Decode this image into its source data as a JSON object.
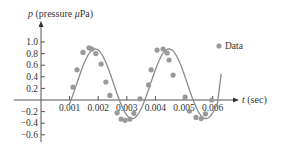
{
  "chart_data": {
    "type": "scatter",
    "title": "",
    "xlabel": "t (sec)",
    "ylabel": "p (pressure μPa)",
    "xlim": [
      0,
      0.0065
    ],
    "ylim": [
      -0.7,
      1.1
    ],
    "grid": false,
    "legend_position": "upper right",
    "x_ticks": [
      0.001,
      0.002,
      0.003,
      0.004,
      0.005,
      0.006
    ],
    "x_tick_labels": [
      "0.001",
      "0.002",
      "0.003",
      "0.004",
      "0.005",
      "0.006"
    ],
    "y_ticks": [
      -0.6,
      -0.4,
      -0.2,
      0.2,
      0.4,
      0.6,
      0.8,
      1.0
    ],
    "y_tick_labels": [
      "−0.6",
      "−0.4",
      "−0.2",
      "0.2",
      "0.4",
      "0.6",
      "0.8",
      "1.0"
    ],
    "series": [
      {
        "name": "Data",
        "kind": "points",
        "color": "#999999",
        "x": [
          0.00112,
          0.00126,
          0.00147,
          0.00168,
          0.00178,
          0.00192,
          0.0021,
          0.00227,
          0.00241,
          0.00266,
          0.0028,
          0.00294,
          0.00311,
          0.00325,
          0.00346,
          0.00376,
          0.00385,
          0.00406,
          0.00427,
          0.00441,
          0.00448,
          0.00462,
          0.00504,
          0.00519,
          0.00542,
          0.0056,
          0.00575,
          0.00597
        ],
        "y": [
          0.22,
          0.52,
          0.82,
          0.9,
          0.88,
          0.8,
          0.62,
          0.31,
          0.08,
          -0.22,
          -0.33,
          -0.35,
          -0.33,
          -0.23,
          0.02,
          0.26,
          0.52,
          0.86,
          0.88,
          0.81,
          0.69,
          0.43,
          0.05,
          -0.19,
          -0.3,
          -0.32,
          -0.24,
          0.0
        ]
      },
      {
        "name": "Fit",
        "kind": "line",
        "color": "#888888",
        "amplitude": 0.6,
        "offset": 0.28,
        "period": 0.00258,
        "phase_zero_t": 0.00105
      }
    ],
    "legend": [
      "Data"
    ]
  },
  "axes": {
    "ylabel_p": "p",
    "ylabel_rest": " (pressure ",
    "ylabel_mu": "μ",
    "ylabel_unit": "Pa)",
    "xlabel_t": "t",
    "xlabel_rest": " (sec)"
  },
  "legend": {
    "label": "Data"
  }
}
